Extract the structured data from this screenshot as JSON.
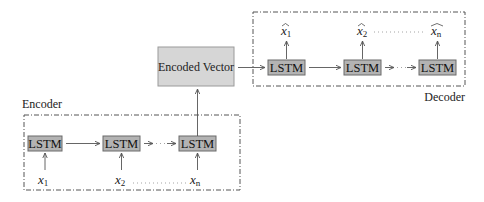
{
  "diagram": {
    "type": "seq2seq-lstm-encoder-decoder",
    "encoder": {
      "label": "Encoder",
      "cells": [
        {
          "label": "LSTM",
          "input": "x",
          "input_sub": "1"
        },
        {
          "label": "LSTM",
          "input": "x",
          "input_sub": "2"
        },
        {
          "label": "LSTM",
          "input": "x",
          "input_sub": "n"
        }
      ]
    },
    "encoded_vector": {
      "label": "Encoded Vector"
    },
    "decoder": {
      "label": "Decoder",
      "cells": [
        {
          "label": "LSTM",
          "output": "x",
          "output_sub": "1",
          "hat": "^"
        },
        {
          "label": "LSTM",
          "output": "x",
          "output_sub": "2",
          "hat": "^"
        },
        {
          "label": "LSTM",
          "output": "x",
          "output_sub": "n",
          "hat": "^"
        }
      ]
    },
    "colors": {
      "lstm_fill": "#b3b3b3",
      "lstm_stroke": "#6a6a6a",
      "encoded_fill": "#d6d6d6",
      "encoded_stroke": "#9a9a9a",
      "line": "#555555"
    }
  }
}
